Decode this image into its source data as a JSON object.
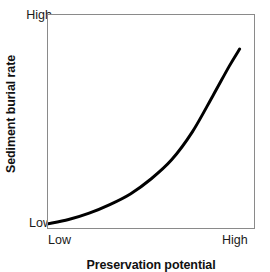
{
  "chart_data": {
    "type": "line",
    "title": "",
    "xlabel": "Preservation potential",
    "ylabel": "Sediment burial rate",
    "x_tick_labels": [
      "Low",
      "High"
    ],
    "y_tick_labels": [
      "Low",
      "High"
    ],
    "xlim": [
      0,
      1
    ],
    "ylim": [
      0,
      1
    ],
    "grid": false,
    "legend": "none",
    "series": [
      {
        "name": "Sediment burial rate vs preservation potential",
        "style": "solid",
        "color": "#000000",
        "line_width_px": 3,
        "relationship": "exponential-increasing",
        "x": [
          0.0,
          0.1,
          0.2,
          0.3,
          0.4,
          0.5,
          0.6,
          0.7,
          0.8,
          0.88,
          0.93
        ],
        "y": [
          0.02,
          0.04,
          0.07,
          0.11,
          0.16,
          0.23,
          0.32,
          0.45,
          0.62,
          0.76,
          0.84
        ]
      }
    ],
    "annotations": [],
    "colors": {
      "curve": "#000000",
      "frame": "#8a8a8a",
      "text": "#1a1a1a",
      "background": "#ffffff"
    }
  },
  "axes": {
    "y_title": "Sediment burial rate",
    "y_high": "High",
    "y_low": "Low",
    "x_title": "Preservation potential",
    "x_low": "Low",
    "x_high": "High"
  }
}
